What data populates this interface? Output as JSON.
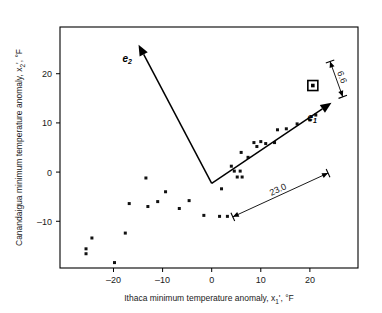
{
  "chart_data": {
    "type": "scatter",
    "title": "",
    "xlabel": "Ithaca minimum temperature anomaly, x1', °F",
    "xlabel_parts": {
      "pre": "Ithaca minimum temperature anomaly, x",
      "sub": "1",
      "post": "', °F"
    },
    "ylabel": "Canandaigua minimum temperature anomaly, x2', °F",
    "ylabel_parts": {
      "pre": "Canandaigua minimum temperature anomaly, x",
      "sub": "2",
      "post": "', °F"
    },
    "xticks": [
      -20,
      -10,
      0,
      10,
      20
    ],
    "xtick_labels": [
      "–20",
      "–10",
      "0",
      "10",
      "20"
    ],
    "yticks": [
      20,
      10,
      0,
      -10
    ],
    "ytick_labels": [
      "20",
      "10",
      "0",
      "–10"
    ],
    "xlim": [
      -30.9,
      29.8
    ],
    "ylim": [
      -19.5,
      29.5
    ],
    "grid": false,
    "legend": null,
    "marker": "square",
    "marker_color": "#111111",
    "marker_size": 3,
    "points": [
      {
        "x": -25.6,
        "y": -15.6
      },
      {
        "x": -25.6,
        "y": -16.6
      },
      {
        "x": -24.4,
        "y": -13.4
      },
      {
        "x": -19.8,
        "y": -18.4
      },
      {
        "x": -17.6,
        "y": -12.4
      },
      {
        "x": -16.8,
        "y": -6.4
      },
      {
        "x": -13.4,
        "y": -1.2
      },
      {
        "x": -13.0,
        "y": -7.0
      },
      {
        "x": -11.0,
        "y": -6.0
      },
      {
        "x": -9.4,
        "y": -4.0
      },
      {
        "x": -6.6,
        "y": -7.4
      },
      {
        "x": -4.6,
        "y": -5.8
      },
      {
        "x": -1.6,
        "y": -8.8
      },
      {
        "x": 1.6,
        "y": -9.0
      },
      {
        "x": 3.2,
        "y": -9.0
      },
      {
        "x": 2.0,
        "y": -3.4
      },
      {
        "x": 4.0,
        "y": 1.2
      },
      {
        "x": 4.6,
        "y": 0.2
      },
      {
        "x": 5.8,
        "y": 0.2
      },
      {
        "x": 5.2,
        "y": -1.0
      },
      {
        "x": 6.2,
        "y": -1.0
      },
      {
        "x": 6.0,
        "y": 4.0
      },
      {
        "x": 7.4,
        "y": 3.0
      },
      {
        "x": 8.6,
        "y": 6.0
      },
      {
        "x": 9.2,
        "y": 5.2
      },
      {
        "x": 10.0,
        "y": 6.2
      },
      {
        "x": 11.0,
        "y": 5.8
      },
      {
        "x": 12.8,
        "y": 6.0
      },
      {
        "x": 13.4,
        "y": 8.6
      },
      {
        "x": 15.2,
        "y": 8.8
      },
      {
        "x": 17.4,
        "y": 9.8
      },
      {
        "x": 20.0,
        "y": 10.6
      },
      {
        "x": 21.2,
        "y": 11.6
      }
    ],
    "highlight_point": {
      "x": 20.6,
      "y": 17.6,
      "style": "square-in-square"
    },
    "vectors": [
      {
        "name": "e1",
        "label": "e",
        "subscript": "1",
        "origin": {
          "x": 0.0,
          "y": -2.3
        },
        "tip": {
          "x": 24.4,
          "y": 14.1
        }
      },
      {
        "name": "e2",
        "label": "e",
        "subscript": "2",
        "origin": {
          "x": 0.0,
          "y": -2.3
        },
        "tip": {
          "x": -14.9,
          "y": 25.9
        }
      }
    ],
    "annotations": [
      {
        "name": "length-along-e1",
        "text": "23.0",
        "bar_start": {
          "x": 4.3,
          "y": -9.1
        },
        "bar_end": {
          "x": 23.7,
          "y": -0.2
        }
      },
      {
        "name": "width-across-e1",
        "text": "6.6",
        "bar_start": {
          "x": 24.1,
          "y": 22.5
        },
        "bar_end": {
          "x": 26.7,
          "y": 15.3
        }
      }
    ]
  },
  "figure": {
    "frame_color": "#000000",
    "background": "#ffffff"
  }
}
